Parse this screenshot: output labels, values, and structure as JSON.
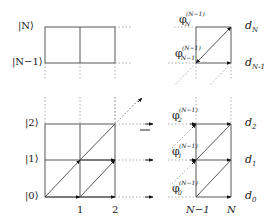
{
  "figure": {
    "colors": {
      "line": "#444444",
      "dotted": "#888888",
      "arrow": "#111111",
      "background": "#ffffff"
    }
  },
  "left_panel": {
    "row_labels": {
      "N": "|N⟩",
      "N_minus_1": "|N−1⟩",
      "two": "|2⟩",
      "one": "|1⟩",
      "zero": "|0⟩"
    },
    "column_ticks": [
      "1",
      "2"
    ]
  },
  "right_panel": {
    "column_ticks": [
      "N−1",
      "N"
    ],
    "d_labels": {
      "dN": {
        "base": "d",
        "sub": "N"
      },
      "dN1": {
        "base": "d",
        "sub": "N-1"
      },
      "d2": {
        "base": "d",
        "sub": "2"
      },
      "d1": {
        "base": "d",
        "sub": "1"
      },
      "d0": {
        "base": "d",
        "sub": "0"
      }
    },
    "phi_labels": {
      "phiN": {
        "base": "φ",
        "sup": "(N−1)",
        "sub": "N"
      },
      "phiN1": {
        "base": "φ",
        "sup": "(N−1)",
        "sub": "N−1"
      },
      "phi2": {
        "base": "φ",
        "sup": "(N−1)",
        "sub": "2"
      },
      "phi1": {
        "base": "φ",
        "sup": "(N−1)",
        "sub": "1"
      },
      "phi0": {
        "base": "φ",
        "sup": "(N−1)",
        "sub": "0"
      }
    }
  }
}
